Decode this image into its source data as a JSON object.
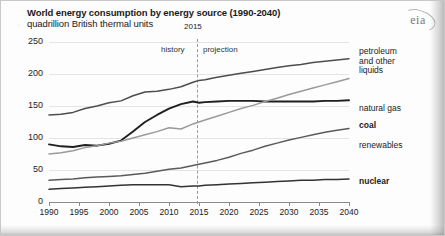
{
  "chart_data": {
    "type": "line",
    "title": "World energy consumption by energy source (1990-2040)",
    "subtitle": "quadrillion British thermal units",
    "ylabel": "",
    "xlabel": "",
    "ylim": [
      0,
      250
    ],
    "xlim": [
      1990,
      2040
    ],
    "yticks": [
      "0",
      "50",
      "100",
      "150",
      "200",
      "250"
    ],
    "ytick_values": [
      0,
      50,
      100,
      150,
      200,
      250
    ],
    "xticks": [
      "1990",
      "1995",
      "2000",
      "2005",
      "2010",
      "2015",
      "2020",
      "2025",
      "2030",
      "2035",
      "2040"
    ],
    "xtick_values": [
      1990,
      1995,
      2000,
      2005,
      2010,
      2015,
      2020,
      2025,
      2030,
      2035,
      2040
    ],
    "grid": true,
    "legend_position": "right-inline",
    "divider_year": 2015,
    "divider_label": "2015",
    "region_left_label": "history",
    "region_right_label": "projection",
    "x": [
      1990,
      1992,
      1994,
      1996,
      1998,
      2000,
      2002,
      2004,
      2006,
      2008,
      2010,
      2012,
      2014,
      2015,
      2016,
      2018,
      2020,
      2022,
      2024,
      2026,
      2028,
      2030,
      2032,
      2034,
      2036,
      2038,
      2040
    ],
    "series": [
      {
        "name": "petroleum and other liquids",
        "label": "petroleum and other liquids",
        "color": "#4d4d4d",
        "values": [
          136,
          137,
          140,
          146,
          150,
          155,
          158,
          166,
          172,
          173,
          176,
          180,
          187,
          190,
          191,
          195,
          198,
          201,
          204,
          207,
          210,
          213,
          215,
          218,
          220,
          222,
          224
        ]
      },
      {
        "name": "coal",
        "label": "coal",
        "color": "#1f1f1f",
        "values": [
          90,
          87,
          86,
          89,
          88,
          91,
          96,
          110,
          125,
          136,
          146,
          153,
          157,
          155,
          156,
          157,
          158,
          158,
          158,
          157,
          157,
          157,
          157,
          157,
          158,
          158,
          159
        ]
      },
      {
        "name": "natural gas",
        "label": "natural gas",
        "color": "#9a9a9a",
        "values": [
          75,
          77,
          80,
          85,
          88,
          92,
          95,
          100,
          105,
          110,
          116,
          114,
          122,
          125,
          128,
          134,
          140,
          146,
          151,
          157,
          162,
          168,
          173,
          178,
          183,
          188,
          193
        ]
      },
      {
        "name": "renewables",
        "label": "renewables",
        "color": "#5a5a5a",
        "values": [
          34,
          35,
          36,
          38,
          39,
          40,
          41,
          43,
          45,
          48,
          51,
          53,
          57,
          59,
          61,
          65,
          70,
          76,
          81,
          87,
          92,
          97,
          101,
          105,
          109,
          112,
          115
        ]
      },
      {
        "name": "nuclear",
        "label": "nuclear",
        "color": "#333333",
        "values": [
          20,
          21,
          22,
          23,
          24,
          25,
          26,
          27,
          27,
          27,
          27,
          24,
          25,
          25,
          26,
          27,
          28,
          29,
          30,
          31,
          32,
          33,
          34,
          34,
          35,
          35,
          36
        ]
      }
    ]
  },
  "logo": {
    "text": "eia"
  }
}
